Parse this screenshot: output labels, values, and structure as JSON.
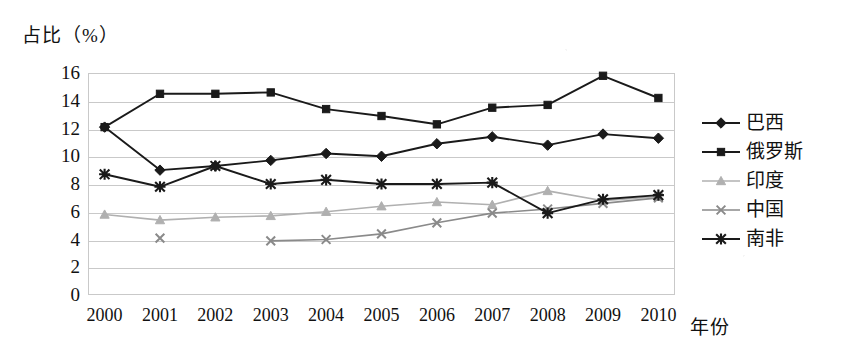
{
  "chart_data": {
    "type": "line",
    "title": "",
    "ylabel": "占比（%）",
    "xlabel": "年份",
    "x": [
      "2000",
      "2001",
      "2002",
      "2003",
      "2004",
      "2005",
      "2006",
      "2007",
      "2008",
      "2009",
      "2010"
    ],
    "categories": [
      "2000",
      "2001",
      "2002",
      "2003",
      "2004",
      "2005",
      "2006",
      "2007",
      "2008",
      "2009",
      "2010"
    ],
    "ylim": [
      0,
      16
    ],
    "yticks": [
      0,
      2,
      4,
      6,
      8,
      10,
      12,
      14,
      16
    ],
    "grid": true,
    "legend_position": "right",
    "series": [
      {
        "name": "巴西",
        "marker": "diamond",
        "color": "#1a1a1a",
        "values": [
          12.1,
          9.0,
          9.3,
          9.7,
          10.2,
          10.0,
          10.9,
          11.4,
          10.8,
          11.6,
          11.3
        ]
      },
      {
        "name": "俄罗斯",
        "marker": "square",
        "color": "#1a1a1a",
        "values": [
          12.1,
          14.5,
          14.5,
          14.6,
          13.4,
          12.9,
          12.3,
          13.5,
          13.7,
          15.8,
          14.2
        ]
      },
      {
        "name": "印度",
        "marker": "triangle",
        "color": "#b0b0b0",
        "values": [
          5.8,
          5.4,
          5.6,
          5.7,
          6.0,
          6.4,
          6.7,
          6.5,
          7.5,
          6.8,
          7.1
        ]
      },
      {
        "name": "中国",
        "marker": "cross",
        "color": "#8a8a8a",
        "values": [
          null,
          4.1,
          null,
          3.9,
          4.0,
          4.4,
          5.2,
          5.9,
          6.2,
          6.6,
          7.0
        ]
      },
      {
        "name": "南非",
        "marker": "star",
        "color": "#1a1a1a",
        "values": [
          8.7,
          7.8,
          9.3,
          8.0,
          8.3,
          8.0,
          8.0,
          8.1,
          5.9,
          6.9,
          7.2
        ]
      }
    ],
    "legend_entries": [
      "巴西",
      "俄罗斯",
      "印度",
      "中国",
      "南非"
    ],
    "colors": {
      "brazil": "#1a1a1a",
      "russia": "#1a1a1a",
      "india": "#b0b0b0",
      "china": "#8a8a8a",
      "south_africa": "#1a1a1a",
      "grid": "#c9c9c9",
      "background": "#ffffff"
    }
  }
}
